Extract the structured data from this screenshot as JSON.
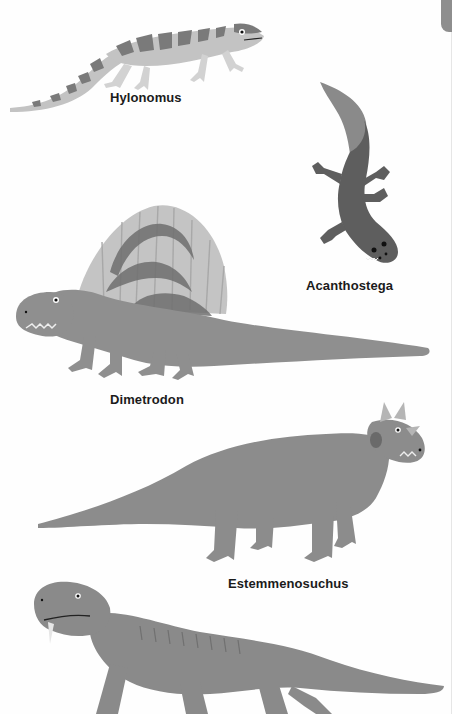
{
  "page": {
    "background": "#fefefe",
    "tab_color": "#8e8e8e"
  },
  "creatures": [
    {
      "name": "Hylonomus",
      "type": "lizard-like reptile",
      "colors": {
        "body": "#c3c3c3",
        "stripes": "#7a7a7a"
      }
    },
    {
      "name": "Acanthostega",
      "type": "early tetrapod",
      "colors": {
        "body": "#5e5e5e",
        "tail_fin": "#8a8a8a"
      }
    },
    {
      "name": "Dimetrodon",
      "type": "sail-backed synapsid",
      "colors": {
        "body": "#8f8f8f",
        "sail": "#c4c4c4",
        "sail_spots": "#6f6f6f"
      }
    },
    {
      "name": "Estemmenosuchus",
      "type": "horned therapsid",
      "colors": {
        "body": "#8c8c8c",
        "horns": "#b5b5b5"
      }
    },
    {
      "name": "Unnamed therapsid",
      "type": "tusked therapsid (partially visible)",
      "colors": {
        "body": "#8a8a8a"
      }
    }
  ],
  "labels": {
    "hylonomus": "Hylonomus",
    "acanthostega": "Acanthostega",
    "dimetrodon": "Dimetrodon",
    "estemmenosuchus": "Estemmenosuchus"
  }
}
